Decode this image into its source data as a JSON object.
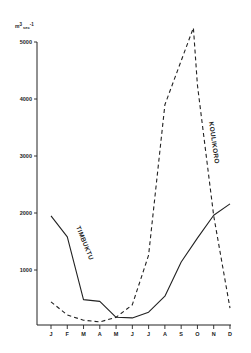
{
  "chart_data": {
    "type": "line",
    "title": "",
    "xlabel": "",
    "ylabel": "m³ sec⁻¹",
    "ylabel_parts": {
      "base": "m",
      "exp1": "3",
      "mid": "sec",
      "exp2": "-1"
    },
    "ylim": [
      0,
      5000
    ],
    "yticks": [
      1000,
      2000,
      3000,
      4000,
      5000
    ],
    "ytick_labels": [
      "1000",
      "2000",
      "3000",
      "4000",
      "5000"
    ],
    "categories": [
      "J",
      "F",
      "M",
      "A",
      "M",
      "J",
      "J",
      "A",
      "S",
      "O",
      "N",
      "D"
    ],
    "grid": false,
    "legend": "inline labels on curves",
    "series": [
      {
        "name": "TIMBUKTU",
        "style": "solid",
        "values": [
          1950,
          1580,
          480,
          450,
          170,
          160,
          260,
          540,
          1140,
          1560,
          1960,
          2160
        ]
      },
      {
        "name": "KOULIKORO",
        "style": "dashed",
        "values": [
          440,
          210,
          120,
          90,
          170,
          390,
          1260,
          3900,
          5100,
          4250,
          1950,
          330
        ],
        "peak": {
          "month_position": 8.75,
          "value": 5250
        }
      }
    ]
  },
  "colors": {
    "line": "#222222",
    "axis": "#222222",
    "background": "#ffffff"
  }
}
